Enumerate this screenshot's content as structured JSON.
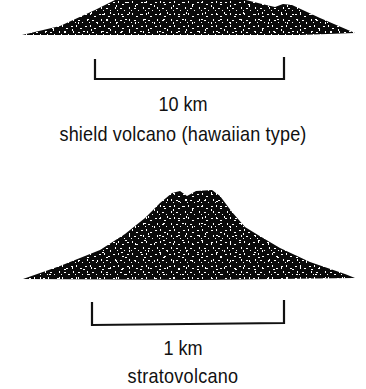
{
  "diagram": {
    "colors": {
      "fill": "#0a0a0a",
      "speckle": "#ffffff",
      "background": "#ffffff",
      "text": "#111111"
    },
    "panels": [
      {
        "id": "shield",
        "scale_label": "10 km",
        "caption": "shield volcano (hawaiian type)",
        "shape": "broad low-angle dome (top cropped at image edge)"
      },
      {
        "id": "strato",
        "scale_label": "1 km",
        "caption": "stratovolcano",
        "shape": "steep-sided cone with twin summit"
      }
    ]
  }
}
